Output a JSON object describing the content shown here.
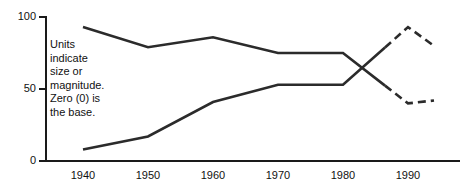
{
  "chart_data": {
    "type": "line",
    "title": "",
    "subtitle": "",
    "xlabel": "",
    "ylabel": "",
    "x": [
      1940,
      1950,
      1960,
      1970,
      1980,
      1990,
      1994
    ],
    "xlim": [
      1936,
      1998
    ],
    "ylim": [
      0,
      100
    ],
    "y_ticks": [
      0,
      50,
      100
    ],
    "y_tick_labels": [
      "0",
      "50",
      "100"
    ],
    "x_ticks": [
      1940,
      1950,
      1960,
      1970,
      1980,
      1990
    ],
    "x_tick_labels": [
      "1940",
      "1950",
      "1960",
      "1970",
      "1980",
      "1990"
    ],
    "grid": false,
    "legend": "none",
    "series": [
      {
        "name": "declining-series",
        "style": "solid-then-dashed",
        "solid_through": 1980,
        "values": [
          93,
          79,
          86,
          75,
          75,
          40,
          42
        ]
      },
      {
        "name": "rising-series",
        "style": "solid-then-dashed",
        "solid_through": 1980,
        "values": [
          8,
          17,
          41,
          53,
          53,
          93,
          80
        ]
      }
    ],
    "annotations": [
      {
        "name": "units-note",
        "lines": [
          "Units",
          "indicate",
          "size or",
          "magnitude.",
          "Zero (0) is",
          "the base."
        ]
      }
    ],
    "colors": {
      "line": "#2b2b2b",
      "axis": "#1a1a1a",
      "text": "#111111",
      "background": "#ffffff"
    }
  },
  "axis": {
    "y_labels": [
      "100",
      "50",
      "0"
    ],
    "x_labels": [
      "1940",
      "1950",
      "1960",
      "1970",
      "1980",
      "1990"
    ]
  },
  "note": {
    "line1": "Units",
    "line2": "indicate",
    "line3": "size or",
    "line4": "magnitude.",
    "line5": "Zero (0) is",
    "line6": "the base."
  }
}
